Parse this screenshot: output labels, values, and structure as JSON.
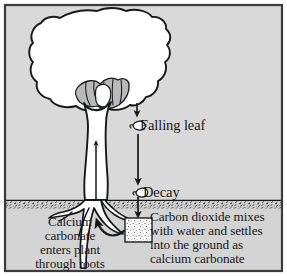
{
  "figure": {
    "type": "scientific-diagram",
    "background_color_sky": "#d9d9d9",
    "background_color_ground": "#d4d4d4",
    "ink_color": "#17181a",
    "tree_fill": "#ffffff",
    "canopy_shade_fill": "#b9b9b9",
    "deposit_box_fill": "#ffffff"
  },
  "labels": {
    "falling_leaf": "Falling leaf",
    "decay": "Decay",
    "roots_uptake": "Calcium\ncarbonate\nenters plant\nthrough roots",
    "deposit": "Carbon dioxide mixes\nwith water and settles\ninto the ground as\ncalcium carbonate"
  },
  "icons": {
    "leaf_falling": "leaf-icon",
    "leaf_decay": "leaf-icon",
    "arrow_canopy_to_leaf": "down-arrow-icon",
    "arrow_leaf_to_decay": "down-arrow-icon",
    "arrow_decay_to_ground": "down-arrow-icon",
    "arrow_deposit_to_roots": "curved-left-arrow-icon",
    "arrow_trunk_up": "up-arrow-icon"
  },
  "elements": {
    "tree_canopy": "tree-canopy",
    "tree_trunk": "tree-trunk",
    "tree_roots": "tree-roots",
    "ground_line": "ground-surface-line",
    "deposit_box": "calcium-carbonate-deposit"
  }
}
